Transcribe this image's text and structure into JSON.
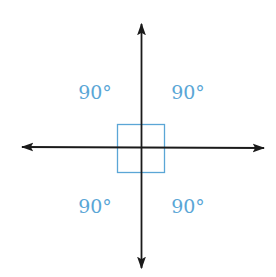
{
  "diagram": {
    "colors": {
      "line": "#1a1a1a",
      "accent": "#5aa6d6",
      "background": "#ffffff"
    },
    "angles": [
      {
        "position": "top-left",
        "label": "90°"
      },
      {
        "position": "top-right",
        "label": "90°"
      },
      {
        "position": "bottom-left",
        "label": "90°"
      },
      {
        "position": "bottom-right",
        "label": "90°"
      }
    ],
    "right_angle_marker": "square"
  }
}
